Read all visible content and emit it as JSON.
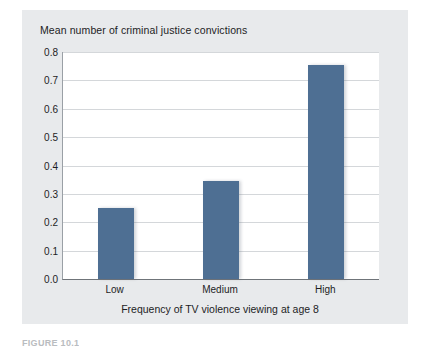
{
  "figure": {
    "caption": "FIGURE 10.1",
    "panel_color": "#e8eaec",
    "background_color": "#ffffff"
  },
  "chart_data": {
    "type": "bar",
    "title": "Mean number of criminal justice convictions",
    "xlabel": "Frequency of TV violence viewing at age 8",
    "ylabel": "",
    "categories": [
      "Low",
      "Medium",
      "High"
    ],
    "values": [
      0.25,
      0.345,
      0.755
    ],
    "ylim": [
      0.0,
      0.8
    ],
    "ytick_labels": [
      "0.8",
      "0.7",
      "0.6",
      "0.5",
      "0.4",
      "0.3",
      "0.2",
      "0.1",
      "0.0"
    ],
    "ytick_values": [
      0.8,
      0.7,
      0.6,
      0.5,
      0.4,
      0.3,
      0.2,
      0.1,
      0.0
    ],
    "grid": true,
    "legend": false,
    "bar_color": "#4e6f93",
    "gridline_color": "#d4d7da"
  }
}
